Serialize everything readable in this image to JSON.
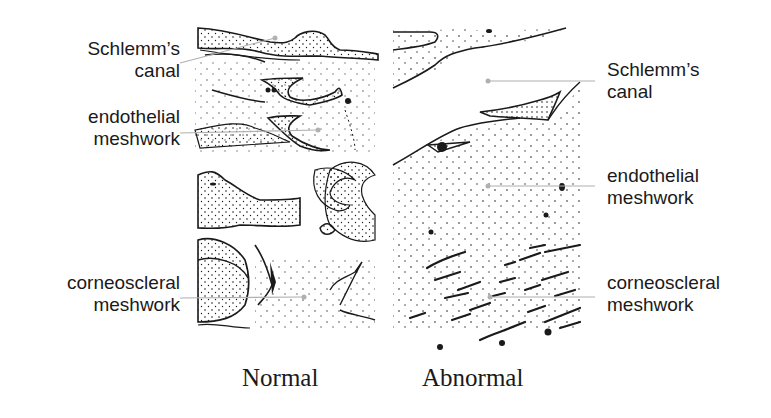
{
  "panels": {
    "normal": {
      "caption": "Normal",
      "labels": {
        "schlemms_canal": {
          "line1": "Schlemm’s",
          "line2": "canal"
        },
        "endothelial_meshwork": {
          "line1": "endothelial",
          "line2": "meshwork"
        },
        "corneoscleral_meshwork": {
          "line1": "corneoscleral",
          "line2": "meshwork"
        }
      }
    },
    "abnormal": {
      "caption": "Abnormal",
      "labels": {
        "schlemms_canal": {
          "line1": "Schlemm’s",
          "line2": "canal"
        },
        "endothelial_meshwork": {
          "line1": "endothelial",
          "line2": "meshwork"
        },
        "corneoscleral_meshwork": {
          "line1": "corneoscleral",
          "line2": "meshwork"
        }
      }
    }
  },
  "colors": {
    "ink": "#1a1a1a",
    "leader_line": "#b0b0b0",
    "background": "#ffffff"
  }
}
